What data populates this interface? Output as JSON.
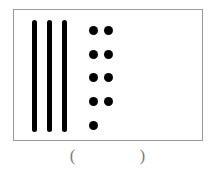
{
  "figure": {
    "type": "place-value-counting-figure",
    "frame": {
      "border_color": "#9a9a9a",
      "background_color": "#ffffff"
    },
    "rods": {
      "name": "tens-rods",
      "count": 3,
      "color": "#000000",
      "unit_value": 10,
      "items": [
        {
          "index": 1
        },
        {
          "index": 2
        },
        {
          "index": 3
        }
      ]
    },
    "dots": {
      "name": "ones-dots",
      "count": 9,
      "color": "#000000",
      "unit_value": 1,
      "rows": [
        {
          "row": 1,
          "dots": 2
        },
        {
          "row": 2,
          "dots": 2
        },
        {
          "row": 3,
          "dots": 2
        },
        {
          "row": 4,
          "dots": 2
        },
        {
          "row": 5,
          "dots": 1
        }
      ]
    }
  },
  "answer": {
    "open_paren": "(",
    "value": "",
    "close_paren": ")",
    "blank_text": "(            )"
  }
}
